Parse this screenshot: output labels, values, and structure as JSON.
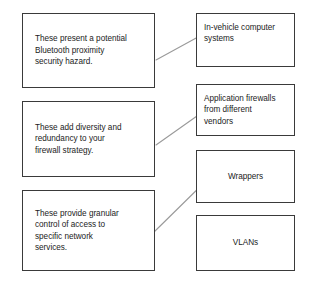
{
  "diagram": {
    "type": "matching-diagram",
    "canvas": {
      "width": 310,
      "height": 282,
      "background": "#ffffff"
    },
    "line_color": "#9a9a9a",
    "border_color": "#3a3a3a",
    "text_color": "#1b1b1b",
    "description_boxes": [
      {
        "id": "desc-bluetooth-hazard",
        "text": "These present a potential\nBluetooth proximity\nsecurity hazard.",
        "x": 22,
        "y": 13,
        "width": 133,
        "height": 75
      },
      {
        "id": "desc-diversity-redundancy",
        "text": "These add diversity and\nredundancy to your\nfirewall strategy.",
        "x": 22,
        "y": 101,
        "width": 133,
        "height": 76
      },
      {
        "id": "desc-granular-control",
        "text": "These provide granular\ncontrol of access to\nspecific network\nservices.",
        "x": 22,
        "y": 190,
        "width": 133,
        "height": 81
      }
    ],
    "term_boxes": [
      {
        "id": "term-in-vehicle-computer-systems",
        "text": "In-vehicle computer\nsystems",
        "align": "top-left",
        "x": 196,
        "y": 13,
        "width": 99,
        "height": 54
      },
      {
        "id": "term-application-firewalls",
        "text": "Application firewalls\nfrom different\nvendors",
        "align": "top-left",
        "x": 196,
        "y": 84,
        "width": 99,
        "height": 52
      },
      {
        "id": "term-wrappers",
        "text": "Wrappers",
        "align": "center",
        "x": 196,
        "y": 150,
        "width": 99,
        "height": 53
      },
      {
        "id": "term-vlans",
        "text": "VLANs",
        "align": "center",
        "x": 196,
        "y": 215,
        "width": 99,
        "height": 56
      }
    ],
    "connectors": [
      {
        "id": "connector-bluetooth-to-in-vehicle",
        "from": "desc-bluetooth-hazard",
        "to": "term-in-vehicle-computer-systems",
        "x1": 156,
        "y1": 60,
        "x2": 198,
        "y2": 37
      },
      {
        "id": "connector-diversity-to-application-firewalls",
        "from": "desc-diversity-redundancy",
        "to": "term-application-firewalls",
        "x1": 156,
        "y1": 145,
        "x2": 197,
        "y2": 116
      },
      {
        "id": "connector-granular-to-wrappers",
        "from": "desc-granular-control",
        "to": "term-wrappers",
        "x1": 152,
        "y1": 234,
        "x2": 212,
        "y2": 175
      }
    ]
  }
}
